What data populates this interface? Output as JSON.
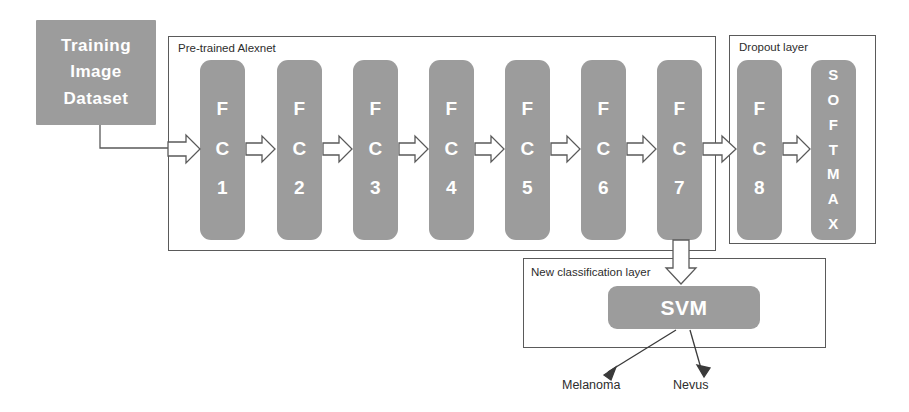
{
  "diagram": {
    "title_blocks": {
      "dataset": {
        "lines": [
          "Training",
          "Image",
          "Dataset"
        ]
      },
      "svm": {
        "label": "SVM"
      }
    },
    "containers": [
      {
        "name": "alexnet",
        "label": "Pre-trained Alexnet"
      },
      {
        "name": "dropout",
        "label": "Dropout layer"
      },
      {
        "name": "new-classification",
        "label": "New classification layer"
      }
    ],
    "fc_layers": [
      {
        "id": "fc1",
        "chars": [
          "F",
          "C",
          "1"
        ],
        "x": 200
      },
      {
        "id": "fc2",
        "chars": [
          "F",
          "C",
          "2"
        ],
        "x": 277
      },
      {
        "id": "fc3",
        "chars": [
          "F",
          "C",
          "3"
        ],
        "x": 353
      },
      {
        "id": "fc4",
        "chars": [
          "F",
          "C",
          "4"
        ],
        "x": 429
      },
      {
        "id": "fc5",
        "chars": [
          "F",
          "C",
          "5"
        ],
        "x": 505
      },
      {
        "id": "fc6",
        "chars": [
          "F",
          "C",
          "6"
        ],
        "x": 581
      },
      {
        "id": "fc7",
        "chars": [
          "F",
          "C",
          "7"
        ],
        "x": 657
      },
      {
        "id": "fc8",
        "chars": [
          "F",
          "C",
          "8"
        ],
        "x": 737
      }
    ],
    "softmax": {
      "id": "softmax",
      "chars": [
        "S",
        "O",
        "F",
        "T",
        "M",
        "A",
        "X"
      ],
      "x": 811
    },
    "outputs": [
      {
        "id": "melanoma",
        "label": "Melanoma"
      },
      {
        "id": "nevus",
        "label": "Nevus"
      }
    ],
    "colors": {
      "block_fill": "#9c9c9c",
      "block_text": "#ffffff",
      "border": "#5a5a5a",
      "label_text": "#2d2d2d",
      "background": "#ffffff"
    }
  }
}
